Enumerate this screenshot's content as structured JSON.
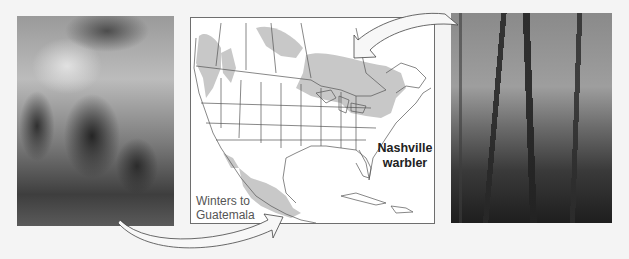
{
  "figure": {
    "species_label_line1": "Nashville",
    "species_label_line2": "warbler",
    "winter_label_line1": "Winters to",
    "winter_label_line2": "Guatemala",
    "left_photo": "tropical forest with palms (wintering habitat)",
    "right_photo": "deciduous temperate forest (breeding habitat)",
    "map_region": "North America",
    "colors": {
      "range_fill": "#c8c8c8",
      "map_lines": "#555555",
      "frame": "#6e6e6e",
      "background": "#f4f4f4"
    },
    "arrows": [
      {
        "from": "left-photo",
        "to": "mexico-winter-range"
      },
      {
        "from": "northeast-breeding-range",
        "to": "right-photo"
      }
    ]
  }
}
